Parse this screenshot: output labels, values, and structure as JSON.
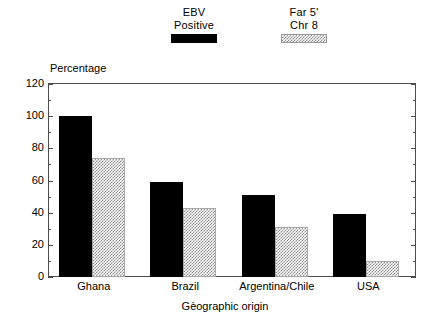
{
  "chart_data": {
    "type": "bar",
    "title": "",
    "xlabel": "Gèographic origin",
    "ylabel": "Percentage",
    "ylim": [
      0,
      120
    ],
    "yticks": [
      0,
      20,
      40,
      60,
      80,
      100,
      120
    ],
    "ytick_labels": [
      "0",
      "20",
      "40",
      "60",
      "80",
      "100",
      "120"
    ],
    "minor_ticks_between": 1,
    "grid": false,
    "legend_position": "top-center",
    "categories": [
      "Ghana",
      "Brazil",
      "Argentina/Chile",
      "USA"
    ],
    "series": [
      {
        "name": "EBV Positive",
        "name_lines": [
          "EBV",
          "Positive"
        ],
        "fill": "solid-black",
        "color": "#000000",
        "values": [
          100,
          59,
          51,
          39
        ]
      },
      {
        "name": "Far 5' Chr 8",
        "name_lines": [
          "Far 5'",
          "Chr 8"
        ],
        "fill": "checkered-gray",
        "color": "#8c8c8c",
        "values": [
          74,
          43,
          31,
          10
        ]
      }
    ]
  },
  "axes": {
    "y_title": "Percentage",
    "x_title": "Gèographic origin"
  },
  "legend": {
    "entries": [
      {
        "line1": "EBV",
        "line2": "Positive",
        "swatch": "solid-swatch"
      },
      {
        "line1": "Far 5'",
        "line2": "Chr 8",
        "swatch": "hatched-swatch"
      }
    ]
  }
}
